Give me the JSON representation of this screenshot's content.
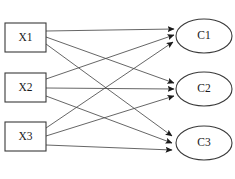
{
  "diagram": {
    "type": "bipartite-graph",
    "title": "",
    "canvas": {
      "width": 235,
      "height": 179,
      "background": "#ffffff"
    },
    "style": {
      "node_stroke": "#3a3a3a",
      "node_fill": "#ffffff",
      "edge_color": "#4a4a4a",
      "label_color": "#1a1a1a"
    },
    "input_nodes": [
      {
        "id": "X1",
        "label": "X1",
        "shape": "rectangle",
        "x": 5,
        "y": 23,
        "width": 41,
        "height": 29
      },
      {
        "id": "X2",
        "label": "X2",
        "shape": "rectangle",
        "x": 5,
        "y": 73,
        "width": 41,
        "height": 29
      },
      {
        "id": "X3",
        "label": "X3",
        "shape": "rectangle",
        "x": 5,
        "y": 122,
        "width": 41,
        "height": 29
      }
    ],
    "output_nodes": [
      {
        "id": "C1",
        "label": "C1",
        "shape": "ellipse",
        "cx": 204,
        "cy": 36,
        "rx": 28,
        "ry": 17
      },
      {
        "id": "C2",
        "label": "C2",
        "shape": "ellipse",
        "cx": 204,
        "cy": 89,
        "rx": 28,
        "ry": 17
      },
      {
        "id": "C3",
        "label": "C3",
        "shape": "ellipse",
        "cx": 204,
        "cy": 143,
        "rx": 28,
        "ry": 17
      }
    ],
    "edges": [
      {
        "from": "X1",
        "to": "C1",
        "x1": 46,
        "y1": 31,
        "x2": 174,
        "y2": 29
      },
      {
        "from": "X1",
        "to": "C2",
        "x1": 46,
        "y1": 37,
        "x2": 174,
        "y2": 83
      },
      {
        "from": "X1",
        "to": "C3",
        "x1": 46,
        "y1": 44,
        "x2": 172,
        "y2": 136
      },
      {
        "from": "X2",
        "to": "C1",
        "x1": 46,
        "y1": 79,
        "x2": 174,
        "y2": 35
      },
      {
        "from": "X2",
        "to": "C2",
        "x1": 46,
        "y1": 88,
        "x2": 174,
        "y2": 89
      },
      {
        "from": "X2",
        "to": "C3",
        "x1": 46,
        "y1": 96,
        "x2": 172,
        "y2": 143
      },
      {
        "from": "X3",
        "to": "C1",
        "x1": 46,
        "y1": 128,
        "x2": 173,
        "y2": 42
      },
      {
        "from": "X3",
        "to": "C2",
        "x1": 46,
        "y1": 136,
        "x2": 174,
        "y2": 96
      },
      {
        "from": "X3",
        "to": "C3",
        "x1": 46,
        "y1": 145,
        "x2": 172,
        "y2": 150
      }
    ],
    "caption": {
      "text": "",
      "visible": true
    }
  }
}
